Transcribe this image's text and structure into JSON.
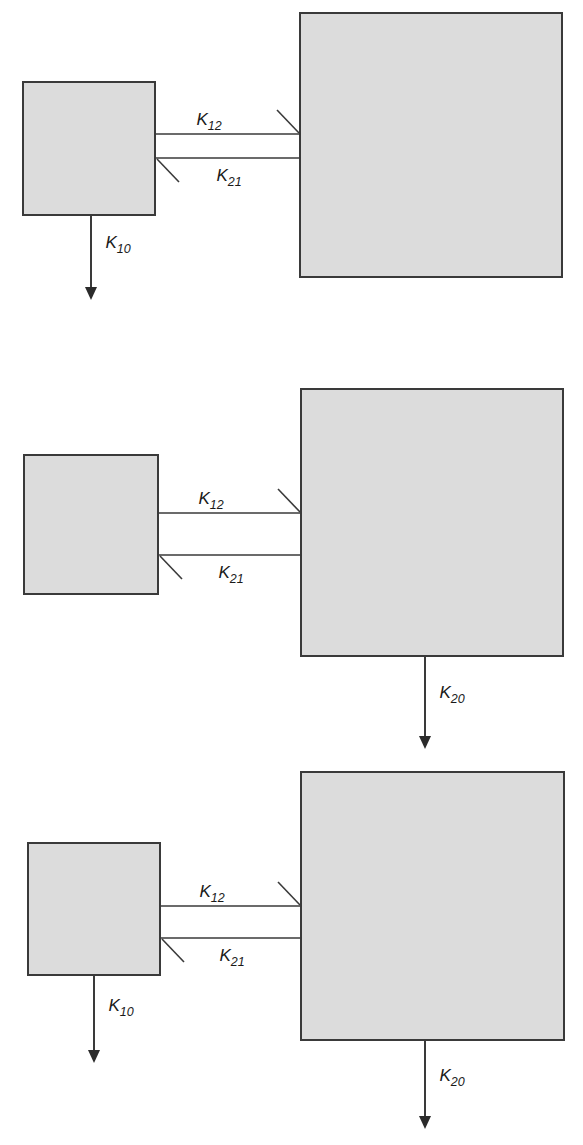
{
  "figure": {
    "type": "compartmental-model-diagram",
    "background_color": "#ffffff",
    "box_fill_color": "#dcdcdc",
    "box_stroke_color": "#3a3a3a",
    "line_color": "#3a3a3a",
    "text_color": "#1a1a1a"
  },
  "labels": {
    "k12": {
      "base": "K",
      "sub": "12"
    },
    "k21": {
      "base": "K",
      "sub": "21"
    },
    "k10": {
      "base": "K",
      "sub": "10"
    },
    "k20": {
      "base": "K",
      "sub": "20"
    }
  },
  "panels": [
    {
      "id": "panel-1",
      "name": "model-elimination-from-central",
      "compartments": [
        {
          "id": "compartment-1",
          "role": "peripheral-small-box",
          "x": 23,
          "y": 82,
          "w": 132,
          "h": 133
        },
        {
          "id": "compartment-2",
          "role": "central-large-box",
          "x": 300,
          "y": 13,
          "w": 262,
          "h": 264
        }
      ],
      "arrows": [
        {
          "id": "k12",
          "label": "k12",
          "direction": "left-to-right",
          "from": "compartment-1",
          "to": "compartment-2"
        },
        {
          "id": "k21",
          "label": "k21",
          "direction": "right-to-left",
          "from": "compartment-2",
          "to": "compartment-1"
        },
        {
          "id": "k10",
          "label": "k10",
          "direction": "downward-out",
          "from": "compartment-1",
          "to": "outside"
        }
      ]
    },
    {
      "id": "panel-2",
      "name": "model-elimination-from-peripheral",
      "compartments": [
        {
          "id": "compartment-1",
          "role": "peripheral-small-box",
          "x": 24,
          "y": 455,
          "w": 134,
          "h": 139
        },
        {
          "id": "compartment-2",
          "role": "central-large-box",
          "x": 301,
          "y": 389,
          "w": 262,
          "h": 267
        }
      ],
      "arrows": [
        {
          "id": "k12",
          "label": "k12",
          "direction": "left-to-right",
          "from": "compartment-1",
          "to": "compartment-2"
        },
        {
          "id": "k21",
          "label": "k21",
          "direction": "right-to-left",
          "from": "compartment-2",
          "to": "compartment-1"
        },
        {
          "id": "k20",
          "label": "k20",
          "direction": "downward-out",
          "from": "compartment-2",
          "to": "outside"
        }
      ]
    },
    {
      "id": "panel-3",
      "name": "model-elimination-from-both",
      "compartments": [
        {
          "id": "compartment-1",
          "role": "peripheral-small-box",
          "x": 28,
          "y": 843,
          "w": 132,
          "h": 132
        },
        {
          "id": "compartment-2",
          "role": "central-large-box",
          "x": 301,
          "y": 772,
          "w": 263,
          "h": 268
        }
      ],
      "arrows": [
        {
          "id": "k12",
          "label": "k12",
          "direction": "left-to-right",
          "from": "compartment-1",
          "to": "compartment-2"
        },
        {
          "id": "k21",
          "label": "k21",
          "direction": "right-to-left",
          "from": "compartment-2",
          "to": "compartment-1"
        },
        {
          "id": "k10",
          "label": "k10",
          "direction": "downward-out",
          "from": "compartment-1",
          "to": "outside"
        },
        {
          "id": "k20",
          "label": "k20",
          "direction": "downward-out",
          "from": "compartment-2",
          "to": "outside"
        }
      ]
    }
  ]
}
